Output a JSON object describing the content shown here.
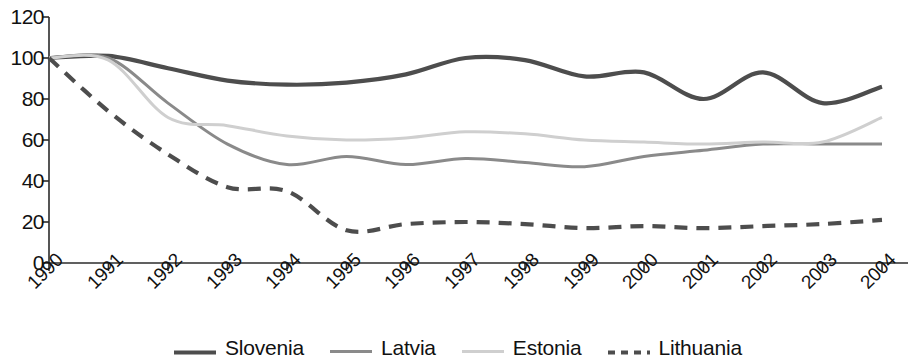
{
  "chart_data": {
    "type": "line",
    "title": "",
    "xlabel": "",
    "ylabel": "",
    "ylim": [
      0,
      120
    ],
    "xlim": [
      1990,
      2004
    ],
    "grid": false,
    "legend_position": "bottom",
    "ytick_labels": [
      "120",
      "100",
      "80",
      "60",
      "40",
      "20",
      "0"
    ],
    "ytick_values": [
      120,
      100,
      80,
      60,
      40,
      20,
      0
    ],
    "categories": [
      "1990",
      "1991",
      "1992",
      "1993",
      "1994",
      "1995",
      "1996",
      "1997",
      "1998",
      "1999",
      "2000",
      "2001",
      "2002",
      "2003",
      "2004"
    ],
    "series": [
      {
        "name": "Slovenia",
        "color": "#4d4d4d",
        "style": "solid",
        "width": 4.2,
        "values": [
          100,
          101,
          95,
          89,
          87,
          88,
          92,
          100,
          99,
          91,
          93,
          80,
          93,
          78,
          86
        ]
      },
      {
        "name": "Latvia",
        "color": "#8a8a8a",
        "style": "solid",
        "width": 3.0,
        "values": [
          100,
          100,
          78,
          58,
          48,
          52,
          48,
          51,
          49,
          47,
          52,
          55,
          58,
          58,
          58
        ]
      },
      {
        "name": "Estonia",
        "color": "#cfcfcf",
        "style": "solid",
        "width": 3.0,
        "values": [
          100,
          99,
          71,
          67,
          62,
          60,
          61,
          64,
          63,
          60,
          59,
          58,
          59,
          59,
          71
        ]
      },
      {
        "name": "Lithuania",
        "color": "#4d4d4d",
        "style": "dashed",
        "width": 4.2,
        "values": [
          100,
          74,
          53,
          37,
          35,
          16,
          19,
          20,
          19,
          17,
          18,
          17,
          18,
          19,
          21
        ]
      }
    ]
  },
  "legend": {
    "items": [
      {
        "label": "Slovenia",
        "swatch": "solid-dark-thick"
      },
      {
        "label": "Latvia",
        "swatch": "solid-gray"
      },
      {
        "label": "Estonia",
        "swatch": "solid-light-gray"
      },
      {
        "label": "Lithuania",
        "swatch": "dashed-dark"
      }
    ]
  },
  "axes": {
    "y_axis_name": "value-axis",
    "x_axis_name": "year-axis"
  }
}
